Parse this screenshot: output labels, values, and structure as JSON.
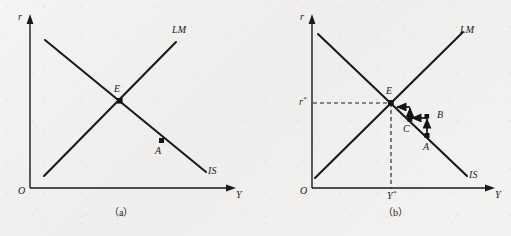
{
  "figure": {
    "type": "is-lm-diagram",
    "background_color": "#f3f2f0",
    "line_color": "#1a1a1a",
    "panel_count": 2
  },
  "panels": [
    {
      "id": "a",
      "caption": "（a）",
      "axes": {
        "y_axis_label": "r",
        "x_axis_label": "Y",
        "origin_label": "O"
      },
      "curves": [
        {
          "name": "LM",
          "label": "LM",
          "slope": "upward"
        },
        {
          "name": "IS",
          "label": "IS",
          "slope": "downward"
        }
      ],
      "points": [
        {
          "label": "E",
          "description": "equilibrium-intersection"
        },
        {
          "label": "A",
          "description": "off-equilibrium-point-on-IS"
        }
      ],
      "ticks": [],
      "dashed_guides": []
    },
    {
      "id": "b",
      "caption": "（b）",
      "axes": {
        "y_axis_label": "r",
        "x_axis_label": "Y",
        "origin_label": "O"
      },
      "curves": [
        {
          "name": "LM",
          "label": "LM",
          "slope": "upward"
        },
        {
          "name": "IS",
          "label": "IS",
          "slope": "downward"
        }
      ],
      "points": [
        {
          "label": "E",
          "description": "equilibrium-intersection"
        },
        {
          "label": "A",
          "description": "starting-point-on-IS"
        },
        {
          "label": "B",
          "description": "second-step-point"
        },
        {
          "label": "C",
          "description": "third-step-point-on-IS"
        }
      ],
      "ticks": [
        {
          "axis": "y",
          "label_base": "r",
          "label_sup": "*"
        },
        {
          "axis": "x",
          "label_base": "Y",
          "label_sup": "*"
        }
      ],
      "dashed_guides": [
        "horizontal-from-r-star-to-E",
        "vertical-from-Y-star-to-E"
      ],
      "adjustment_path": {
        "description": "staircase convergence toward equilibrium E",
        "steps": [
          "A",
          "B",
          "C",
          "E"
        ],
        "arrow_sequence": [
          "A-to-B-up",
          "B-to-C-left",
          "C-to-up",
          "to-E-left"
        ]
      }
    }
  ]
}
